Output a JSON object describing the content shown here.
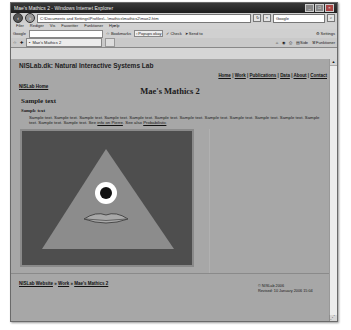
{
  "browser": {
    "window_title": "Mae's Mathics 2 - Windows Internet Explorer",
    "address": "C:\\Documents and Settings\\Profiles\\...\\mathics\\mathics2\\mae2.htm",
    "search_placeholder": "Google",
    "menu": [
      "Filer",
      "Rediger",
      "Vis",
      "Favoritter",
      "Funktioner",
      "Hjælp"
    ],
    "google_label": "Google",
    "toolbar_items": [
      {
        "icon": "bookmark-icon",
        "label": "Bookmarks"
      },
      {
        "icon": "popup-icon",
        "label": "Popups okay"
      },
      {
        "icon": "check-icon",
        "label": "Check"
      },
      {
        "icon": "send-icon",
        "label": "Send to"
      },
      {
        "icon": "settings-icon",
        "label": "Settings"
      }
    ],
    "tab_label": "Mae's Mathics 2",
    "tab_tools": [
      {
        "icon": "home-icon",
        "label": ""
      },
      {
        "icon": "feed-icon",
        "label": ""
      },
      {
        "icon": "print-icon",
        "label": ""
      },
      {
        "icon": "page-icon",
        "label": "Side"
      },
      {
        "icon": "tools-icon",
        "label": "Funktioner"
      }
    ]
  },
  "page": {
    "site_header": "NISLab.dk: Natural Interactive Systems Lab",
    "top_nav": [
      "Home",
      "Work",
      "Publications",
      "Data",
      "About",
      "Contact"
    ],
    "home_link": "NISLab Home",
    "title": "Mae's Mathics 2",
    "section_heading": "Sample text",
    "sub_heading": "Sample text",
    "paragraph_text": "Sample text. Sample text. Sample text. Sample text. Sample text. Sample text. Sample text. Sample text. Sample text. Sample text. Sample text. Sample text. Sample text. Sample text. See",
    "paragraph_link1": "info on Pierre",
    "paragraph_mid": ". See also",
    "paragraph_link2": "Probabilistic",
    "figure": {
      "background": "#4e4e4e",
      "triangle_color": "#8c8c8c",
      "eye_white": "#ffffff",
      "pupil": "#111111",
      "lips_color": "#a8a8a8"
    },
    "breadcrumb": [
      "NISLab Website",
      "Work",
      "Mae's Mathics 2"
    ],
    "breadcrumb_sep": "»",
    "footer_copyright": "© NISLab 2006",
    "footer_revised": "Revised: 10 January 2006 15:04"
  }
}
